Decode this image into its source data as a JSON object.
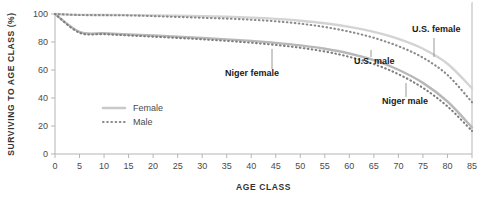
{
  "chart_data": {
    "type": "line",
    "title": "",
    "xlabel": "AGE CLASS",
    "ylabel": "SURVIVING TO AGE CLASS (%)",
    "xlim": [
      0,
      85
    ],
    "ylim": [
      0,
      100
    ],
    "xticks": [
      0,
      5,
      10,
      15,
      20,
      25,
      30,
      35,
      40,
      45,
      50,
      55,
      60,
      65,
      70,
      75,
      80,
      85
    ],
    "yticks": [
      0,
      20,
      40,
      60,
      80,
      100
    ],
    "grid": false,
    "legend_position": "center-left",
    "legend": [
      {
        "label": "Female",
        "style": "solid",
        "color": "#c9c9c9"
      },
      {
        "label": "Male",
        "style": "dotted",
        "color": "#8a8a8a"
      }
    ],
    "x": [
      0,
      5,
      10,
      15,
      20,
      25,
      30,
      35,
      40,
      45,
      50,
      55,
      60,
      65,
      70,
      75,
      80,
      85
    ],
    "series": [
      {
        "name": "U.S. female",
        "style": "solid",
        "color": "#d3d3d3",
        "values": [
          100,
          99.4,
          99.3,
          99.2,
          99.0,
          98.7,
          98.4,
          98.0,
          97.4,
          96.5,
          95.2,
          93.4,
          90.8,
          87.2,
          82.2,
          75.2,
          64.5,
          47.0
        ]
      },
      {
        "name": "U.S. male",
        "style": "dotted",
        "color": "#8a8a8a",
        "values": [
          100,
          99.3,
          99.2,
          99.0,
          98.5,
          97.9,
          97.3,
          96.7,
          95.9,
          94.8,
          93.1,
          90.7,
          87.4,
          83.0,
          77.0,
          68.8,
          56.5,
          37.0
        ]
      },
      {
        "name": "Niger female",
        "style": "solid",
        "color": "#b8b8b8",
        "values": [
          100,
          87.2,
          86.2,
          85.4,
          84.6,
          83.8,
          82.9,
          81.9,
          80.8,
          79.4,
          77.6,
          75.2,
          71.8,
          67.0,
          60.2,
          50.8,
          37.5,
          19.0
        ]
      },
      {
        "name": "Niger male",
        "style": "dotted",
        "color": "#7d7d7d",
        "values": [
          100,
          86.6,
          85.6,
          84.7,
          83.8,
          82.9,
          81.9,
          80.8,
          79.5,
          77.9,
          75.9,
          73.2,
          69.4,
          64.2,
          57.0,
          47.2,
          34.0,
          16.5
        ]
      }
    ],
    "annotations": [
      {
        "text": "U.S. female",
        "label_x": 412,
        "label_y": 32,
        "leader_x": 434,
        "leader_y0": 38,
        "leader_y1": 57
      },
      {
        "text": "U.S. male",
        "label_x": 354,
        "label_y": 64,
        "leader_x": 371,
        "leader_y0": 57,
        "leader_y1": 50
      },
      {
        "text": "Niger female",
        "label_x": 225,
        "label_y": 76,
        "leader_x": 272,
        "leader_y0": 69,
        "leader_y1": 49
      },
      {
        "text": "Niger male",
        "label_x": 382,
        "label_y": 104,
        "leader_x": 406,
        "leader_y0": 97,
        "leader_y1": 83
      }
    ]
  }
}
